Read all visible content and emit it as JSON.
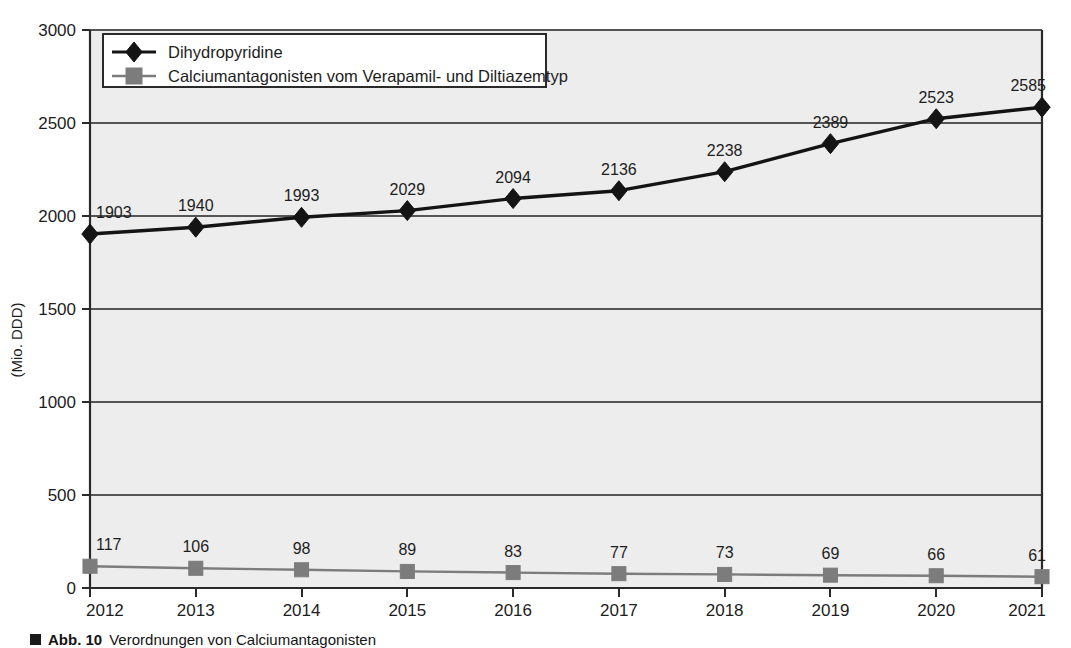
{
  "chart_data": {
    "type": "line",
    "title": "",
    "xlabel": "",
    "ylabel": "(Mio. DDD)",
    "categories": [
      "2012",
      "2013",
      "2014",
      "2015",
      "2016",
      "2017",
      "2018",
      "2019",
      "2020",
      "2021"
    ],
    "ylim": [
      0,
      3000
    ],
    "yticks": [
      "0",
      "500",
      "1000",
      "1500",
      "2000",
      "2500",
      "3000"
    ],
    "ytick_values": [
      0,
      500,
      1000,
      1500,
      2000,
      2500,
      3000
    ],
    "grid": true,
    "legend_position": "top-left",
    "series": [
      {
        "name": "Dihydropyridine",
        "marker": "diamond",
        "color": "#141414",
        "values": [
          1903,
          1940,
          1993,
          2029,
          2094,
          2136,
          2238,
          2389,
          2523,
          2585
        ],
        "labels": [
          "1903",
          "1940",
          "1993",
          "2029",
          "2094",
          "2136",
          "2238",
          "2389",
          "2523",
          "2585"
        ]
      },
      {
        "name": "Calciumantagonisten vom Verapamil- und Diltiazemtyp",
        "marker": "square",
        "color": "#7c7c7c",
        "values": [
          117,
          106,
          98,
          89,
          83,
          77,
          73,
          69,
          66,
          61
        ],
        "labels": [
          "117",
          "106",
          "98",
          "89",
          "83",
          "77",
          "73",
          "69",
          "66",
          "61"
        ]
      }
    ]
  },
  "colors": {
    "plot_background": "#ededed",
    "gridline": "#555555",
    "axis": "#2a2a2a",
    "series_primary": "#141414",
    "series_secondary": "#7c7c7c",
    "legend_background": "#ffffff",
    "legend_border": "#2a2a2a"
  },
  "legend": {
    "entries": [
      {
        "label": "Dihydropyridine",
        "marker": "diamond-marker-icon"
      },
      {
        "label": "Calciumantagonisten vom Verapamil- und Diltiazemtyp",
        "marker": "square-marker-icon"
      }
    ]
  },
  "axes": {
    "y_title": "(Mio. DDD)",
    "y_ticks": [
      "3000",
      "2500",
      "2000",
      "1500",
      "1000",
      "500",
      "0"
    ],
    "x_ticks": [
      "2012",
      "2013",
      "2014",
      "2015",
      "2016",
      "2017",
      "2018",
      "2019",
      "2020",
      "2021"
    ]
  },
  "caption": {
    "marker": "square-bullet-icon",
    "label": "Abb. 10",
    "text": "Verordnungen von Calciumantagonisten"
  }
}
